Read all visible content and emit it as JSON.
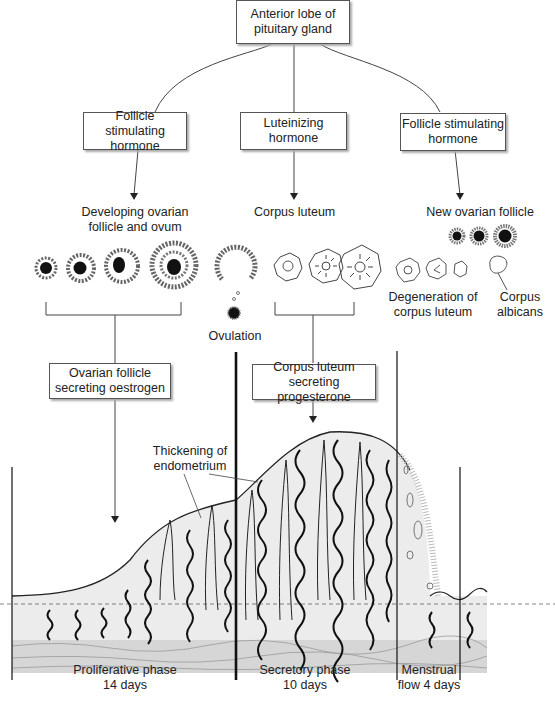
{
  "diagram": {
    "pituitary": {
      "line1": "Anterior lobe of",
      "line2": "pituitary gland"
    },
    "hormones": [
      {
        "line1": "Follicle stimulating",
        "line2": "hormone"
      },
      {
        "line1": "Luteinizing",
        "line2": "hormone"
      },
      {
        "line1": "Follicle stimulating",
        "line2": "hormone"
      }
    ],
    "ovary_labels": {
      "developing": {
        "line1": "Developing ovarian",
        "line2": "follicle and ovum"
      },
      "corpus_luteum": "Corpus luteum",
      "new_follicle": "New ovarian follicle",
      "degeneration": {
        "line1": "Degeneration of",
        "line2": "corpus luteum"
      },
      "albicans": {
        "line1": "Corpus",
        "line2": "albicans"
      },
      "ovulation": "Ovulation"
    },
    "secretion_boxes": [
      {
        "line1": "Ovarian follicle",
        "line2": "secreting oestrogen"
      },
      {
        "line1": "Corpus luteum",
        "line2": "secreting progesterone"
      }
    ],
    "endometrium_label": {
      "line1": "Thickening of",
      "line2": "endometrium"
    },
    "phases": [
      {
        "name": "Proliferative phase",
        "duration": "14 days"
      },
      {
        "name": "Secretory phase",
        "duration": "10 days"
      },
      {
        "name": "Menstrual",
        "duration": "flow 4 days"
      }
    ],
    "colors": {
      "line": "#333333",
      "fill_light": "#ececec",
      "fill_basal": "#d6d6d6",
      "follicle_core": "#111111"
    }
  }
}
